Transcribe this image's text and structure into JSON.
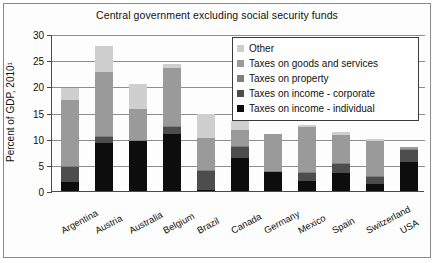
{
  "chart_data": {
    "type": "bar",
    "subtype": "stacked-vertical",
    "title": "Central government excluding social security funds",
    "xlabel": "",
    "ylabel": "Percent of GDP, 2010¹",
    "ylim": [
      0,
      30
    ],
    "yticks": [
      0,
      5,
      10,
      15,
      20,
      25,
      30
    ],
    "grid": true,
    "legend_position": "top-right-inside",
    "categories": [
      "Argentina",
      "Austria",
      "Australia",
      "Belgium",
      "Brazil",
      "Canada",
      "Germany",
      "Mexico",
      "Spain",
      "Switzerland",
      "USA"
    ],
    "series": [
      {
        "name": "Taxes on income - individual",
        "color": "#0d0d0d",
        "values": [
          1.7,
          9.1,
          9.5,
          10.9,
          0.2,
          6.4,
          3.6,
          1.9,
          3.5,
          1.3,
          5.6
        ]
      },
      {
        "name": "Taxes on income - corporate",
        "color": "#4d4d4d",
        "values": [
          2.8,
          1.2,
          0.0,
          1.3,
          3.6,
          2.0,
          0.0,
          1.6,
          1.7,
          1.3,
          2.2
        ]
      },
      {
        "name": "Taxes on property",
        "color": "#7f7f7f",
        "values": [
          0.2,
          0.2,
          0.2,
          0.2,
          0.2,
          0.2,
          0.2,
          0.2,
          0.2,
          0.2,
          0.2
        ]
      },
      {
        "name": "Taxes on goods and services",
        "color": "#9a9a9a",
        "values": [
          12.7,
          12.2,
          6.0,
          11.1,
          6.2,
          3.1,
          7.1,
          8.5,
          5.3,
          6.7,
          0.4
        ]
      },
      {
        "name": "Other",
        "color": "#cfcfcf",
        "values": [
          2.2,
          5.0,
          4.8,
          0.7,
          4.5,
          1.6,
          0.0,
          0.4,
          0.6,
          0.4,
          0.0
        ]
      }
    ],
    "totals": [
      19.6,
      27.7,
      20.5,
      24.2,
      14.7,
      13.3,
      10.9,
      12.6,
      11.3,
      9.9,
      8.4
    ]
  },
  "axis": {
    "ytick_labels": [
      "0",
      "5",
      "10",
      "15",
      "20",
      "25",
      "30"
    ]
  }
}
